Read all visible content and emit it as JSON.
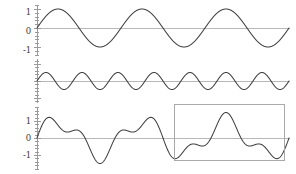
{
  "figure": {
    "width": 296,
    "height": 174,
    "background": "#ffffff",
    "curve_color": "#404040",
    "zero_line_color": "#b8b8b8",
    "axis_color": "#9a9a9a",
    "highlight_color": "#a9a9a9"
  },
  "chart_data": [
    {
      "type": "line",
      "title": "",
      "name": "low-frequency-sine",
      "xlabel": "",
      "ylabel": "",
      "xlim": [
        0,
        1
      ],
      "ylim": [
        -1.45,
        1.45
      ],
      "yticks": [
        1,
        0,
        -1
      ],
      "ytick_labels": [
        "1",
        "0",
        "-1"
      ],
      "grid": false,
      "legend": "none",
      "formula": "sin(2*pi*3*x)",
      "amplitude": 1,
      "cycles": 3,
      "phase": 0
    },
    {
      "type": "line",
      "title": "",
      "name": "high-frequency-sine",
      "xlabel": "",
      "ylabel": "",
      "xlim": [
        0,
        1
      ],
      "ylim": [
        -1.45,
        1.45
      ],
      "yticks": [
        1,
        0,
        -1
      ],
      "ytick_labels": [
        "1",
        "0",
        "-1"
      ],
      "grid": false,
      "legend": "none",
      "formula": "0.5*sin(2*pi*7*x)",
      "amplitude": 0.5,
      "cycles": 7,
      "phase": 0
    },
    {
      "type": "line",
      "title": "",
      "name": "composite-sum-signal",
      "xlabel": "",
      "ylabel": "",
      "xlim": [
        0,
        1
      ],
      "ylim": [
        -1.7,
        1.7
      ],
      "yticks": [
        1,
        0,
        -1
      ],
      "ytick_labels": [
        "1",
        "0",
        "-1"
      ],
      "grid": false,
      "legend": "none",
      "formula": "sin(2*pi*3*x) + 0.5*sin(2*pi*7*x)",
      "amplitude": 1.5,
      "cycles": 3,
      "phase": 0,
      "annotation": {
        "type": "rectangle",
        "label": "selection-region",
        "x_range": [
          0.555,
          1.0
        ]
      }
    }
  ],
  "panels": [
    {
      "id": "panel-1",
      "top": 4,
      "height": 52,
      "zero_y": 28,
      "unit": 19,
      "tick_labels": [
        {
          "text": "1",
          "value": 1
        },
        {
          "text": "0",
          "value": 0
        },
        {
          "text": "-1",
          "value": -1
        }
      ]
    },
    {
      "id": "panel-2",
      "top": 58,
      "height": 46,
      "zero_y": 81,
      "unit": 17,
      "tick_labels": [
        {
          "text": "1",
          "value": 1
        },
        {
          "text": "0",
          "value": 0
        },
        {
          "text": "-1",
          "value": -1
        }
      ]
    },
    {
      "id": "panel-3",
      "top": 106,
      "height": 64,
      "zero_y": 138,
      "unit": 17,
      "tick_labels": [
        {
          "text": "1",
          "value": 1
        },
        {
          "text": "0",
          "value": 0
        },
        {
          "text": "-1",
          "value": -1
        }
      ]
    }
  ],
  "axis": {
    "x_position": 37,
    "plot_left": 37,
    "plot_right": 289,
    "minor_ticks_per_unit": 5
  },
  "highlight": {
    "x": 174,
    "y": 104,
    "width": 111,
    "height": 57
  }
}
